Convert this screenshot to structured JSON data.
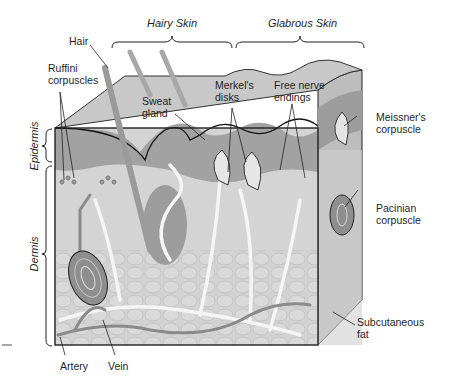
{
  "figure": {
    "type": "anatomical-diagram",
    "colors": {
      "background": "#ffffff",
      "surface_top": "#c9c9c9",
      "epidermis_dark": "#9a9a9a",
      "dermis": "#d6d6d6",
      "fat_lobules": "#cfcfcf",
      "nerve_white": "#f4f4f4",
      "vessel_gray": "#8a8a8a",
      "outline": "#222222",
      "text": "#1f1f1f"
    }
  },
  "region_brackets": {
    "hairy_skin": "Hairy Skin",
    "glabrous_skin": "Glabrous Skin"
  },
  "layer_brackets": {
    "epidermis": "Epidermis",
    "dermis": "Dermis"
  },
  "labels": {
    "hair": "Hair",
    "ruffini": "Ruffini\ncorpuscles",
    "sweat_gland": "Sweat\ngland",
    "merkel": "Merkel's\ndisks",
    "free_nerve": "Free nerve\nendings",
    "meissner": "Meissner's\ncorpuscle",
    "pacinian": "Pacinian\ncorpuscle",
    "subcutaneous": "Subcutaneous\nfat",
    "artery": "Artery",
    "vein": "Vein"
  }
}
